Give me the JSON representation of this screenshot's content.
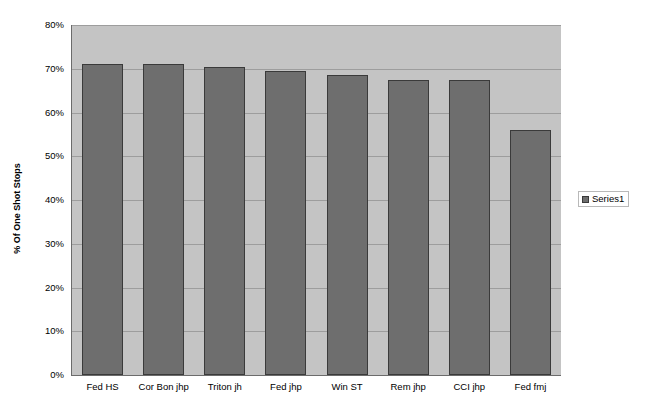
{
  "chart_data": {
    "type": "bar",
    "title": "",
    "xlabel": "",
    "ylabel": "% Of One Shot Stops",
    "categories": [
      "Fed HS",
      "Cor Bon jhp",
      "Triton jh",
      "Fed jhp",
      "Win ST",
      "Rem jhp",
      "CCI jhp",
      "Fed fmj"
    ],
    "series": [
      {
        "name": "Series1",
        "values": [
          71,
          71,
          70.5,
          69.5,
          68.5,
          67.5,
          67.5,
          56
        ]
      }
    ],
    "ylim": [
      0,
      80
    ],
    "ytick_labels": [
      "80%",
      "70%",
      "60%",
      "50%",
      "40%",
      "30%",
      "20%",
      "10%",
      "0%"
    ],
    "ytick_values": [
      80,
      70,
      60,
      50,
      40,
      30,
      20,
      10,
      0
    ],
    "grid": true,
    "legend_position": "right",
    "colors": {
      "bar_fill": "#6e6e6e",
      "bar_border": "#3a3a3a",
      "plot_background": "#c4c4c4",
      "gridline": "#9d9d9d",
      "axis_line": "#6b6b6b",
      "page_background": "#ffffff"
    }
  },
  "legend": {
    "entries": [
      {
        "label": "Series1",
        "swatch_name": "series1-swatch"
      }
    ]
  }
}
